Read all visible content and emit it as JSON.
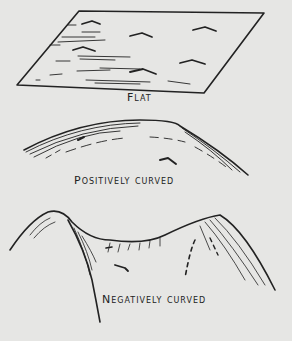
{
  "diagram": {
    "type": "surface-curvature-illustration",
    "panels": [
      {
        "id": "flat",
        "label": "Flat"
      },
      {
        "id": "positive",
        "label": "Positively curved"
      },
      {
        "id": "negative",
        "label": "Negatively curved"
      }
    ]
  },
  "colors": {
    "background": "#e6e6e4",
    "ink": "#222222"
  }
}
